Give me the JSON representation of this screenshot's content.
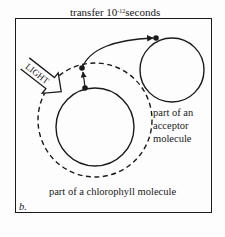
{
  "figure": {
    "panel_label": "b.",
    "transfer_label": {
      "prefix": "transfer 10",
      "exponent": "-12",
      "suffix": "seconds"
    },
    "light_label": "LIGHT",
    "acceptor_label": [
      "part of an",
      "acceptor",
      "molecule"
    ],
    "chlorophyll_label": "part of a chlorophyll molecule"
  },
  "diagram": {
    "elements": [
      {
        "id": "chlorophyll-inner-orbit",
        "type": "circle",
        "style": "solid"
      },
      {
        "id": "chlorophyll-excited-orbit",
        "type": "circle",
        "style": "dashed"
      },
      {
        "id": "acceptor-orbit",
        "type": "circle",
        "style": "solid"
      },
      {
        "id": "electron-ground",
        "type": "dot"
      },
      {
        "id": "electron-excited",
        "type": "dot"
      },
      {
        "id": "electron-acceptor",
        "type": "dot"
      },
      {
        "id": "excitation-arrow",
        "type": "arrow",
        "from": "electron-ground",
        "to": "electron-excited"
      },
      {
        "id": "transfer-arrow",
        "type": "curved-arrow",
        "from": "electron-excited",
        "to": "electron-acceptor"
      },
      {
        "id": "light-arrow",
        "type": "block-arrow",
        "label": "LIGHT"
      }
    ],
    "colors": {
      "ink": "#1a1a1a",
      "background": "#fdfdfd"
    }
  }
}
